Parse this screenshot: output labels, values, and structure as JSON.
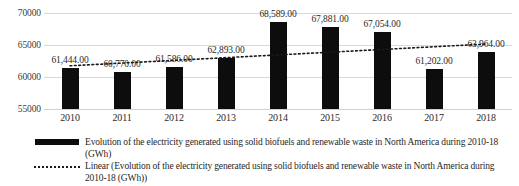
{
  "chart_data": {
    "type": "bar",
    "title": "",
    "xlabel": "",
    "ylabel": "",
    "categories": [
      "2010",
      "2011",
      "2012",
      "2013",
      "2014",
      "2015",
      "2016",
      "2017",
      "2018"
    ],
    "values": [
      61444,
      60770,
      61586,
      62893,
      68589,
      67881,
      67054,
      61202,
      63964
    ],
    "value_labels": [
      "61,444.00",
      "60,770.00",
      "61,586.00",
      "62,893.00",
      "68,589.00",
      "67,881.00",
      "67,054.00",
      "61,202.00",
      "63,964.00"
    ],
    "ylim": [
      55000,
      70000
    ],
    "yticks": [
      55000,
      60000,
      65000,
      70000
    ],
    "ytick_labels": [
      "55000",
      "60000",
      "65000",
      "70000"
    ],
    "grid": true,
    "legend_position": "bottom",
    "series": [
      {
        "name": "Evolution of the electricity generated using solid biofuels and renewable waste in North America during 2010-18 (GWh)",
        "type": "bar",
        "color": "#0d0d0d",
        "values": [
          61444,
          60770,
          61586,
          62893,
          68589,
          67881,
          67054,
          61202,
          63964
        ]
      },
      {
        "name": "Linear (Evolution of the electricity generated using solid biofuels and renewable waste in North America during 2010-18 (GWh))",
        "type": "trendline",
        "style": "dotted",
        "color": "#1a1a1a",
        "start_value": 61750,
        "end_value": 65150
      }
    ]
  },
  "yaxis": {
    "ticks": [
      {
        "label": "70000",
        "value": 70000
      },
      {
        "label": "65000",
        "value": 65000
      },
      {
        "label": "60000",
        "value": 60000
      },
      {
        "label": "55000",
        "value": 55000
      }
    ]
  },
  "legend": {
    "items": [
      {
        "marker": "bar-swatch",
        "label": "Evolution of the electricity generated using solid biofuels and renewable waste in North America during 2010-18 (GWh)"
      },
      {
        "marker": "dotted-line-swatch",
        "label": "Linear (Evolution of the electricity generated using solid biofuels and renewable waste in North America during 2010-18 (GWh))"
      }
    ]
  },
  "colors": {
    "bar": "#0d0d0d",
    "gridline": "#d9d9d9",
    "trendline": "#1a1a1a",
    "text": "#1f1f1f",
    "background": "#ffffff"
  }
}
